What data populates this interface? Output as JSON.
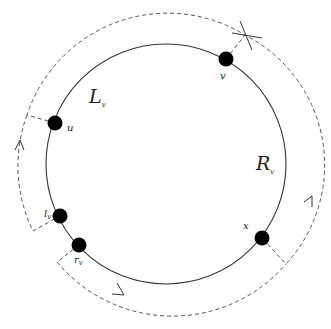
{
  "diagram": {
    "type": "cycle-diagram",
    "colors": {
      "stroke": "#333333",
      "dashed": "#555555",
      "node": "#000000",
      "background": "#ffffff"
    },
    "circle": {
      "cx": 166,
      "cy": 164,
      "r": 120
    },
    "region_labels": [
      {
        "id": "Lv",
        "base": "L",
        "sub": "v"
      },
      {
        "id": "Rv",
        "base": "R",
        "sub": "v"
      }
    ],
    "nodes": [
      {
        "id": "v",
        "base": "v",
        "sub": "",
        "x": 226,
        "y": 59
      },
      {
        "id": "u",
        "base": "u",
        "sub": "",
        "x": 55,
        "y": 123
      },
      {
        "id": "lv",
        "base": "l",
        "sub": "v",
        "x": 60,
        "y": 216
      },
      {
        "id": "rv",
        "base": "r",
        "sub": "v",
        "x": 79,
        "y": 245
      },
      {
        "id": "x",
        "base": "x",
        "sub": "",
        "x": 262,
        "y": 238
      }
    ],
    "dashed_paths": [
      {
        "id": "left-arc",
        "description": "from u outward then clockwise-counter path down to l_v with upward arrow"
      },
      {
        "id": "top-right-arc",
        "description": "from u over the top, crossing at v marker, down right side to x with upward arrow"
      },
      {
        "id": "bottom-arc",
        "description": "from r_v outward then along bottom toward x with rightward arrow"
      }
    ],
    "cross_marker": {
      "near": "v",
      "x": 245,
      "y": 35
    }
  }
}
